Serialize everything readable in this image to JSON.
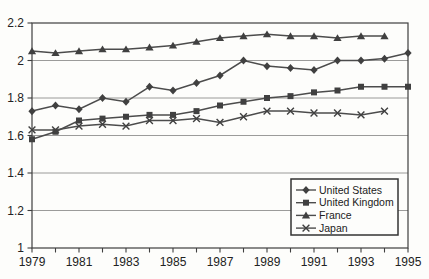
{
  "colors": {
    "background": "#fdfdfb",
    "axis": "#3f3f3f",
    "grid": "#828282",
    "line": "#4c4c4c",
    "marker": "#404040",
    "text": "#222222",
    "legend_border": "#333333",
    "legend_bg": "#fdfdfb"
  },
  "chart_data": {
    "type": "line",
    "title": "",
    "xlabel": "",
    "ylabel": "",
    "xlim": [
      1979,
      1995
    ],
    "ylim": [
      1,
      2.2
    ],
    "grid": "horizontal",
    "x_tick_labels": [
      "1979",
      "1981",
      "1983",
      "1985",
      "1987",
      "1989",
      "1991",
      "1993",
      "1995"
    ],
    "x_minor_tick_step": 1,
    "y_ticks": [
      1,
      1.2,
      1.4,
      1.6,
      1.8,
      2,
      2.2
    ],
    "y_tick_labels": [
      "1",
      "1.2",
      "1.4",
      "1.6",
      "1.8",
      "2",
      "2.2"
    ],
    "y_gridlines": [
      1.2,
      1.4,
      1.6,
      1.8,
      2
    ],
    "legend": {
      "position": "inside-bottom-right",
      "items": [
        "United States",
        "United Kingdom",
        "France",
        "Japan"
      ]
    },
    "series": [
      {
        "name": "United States",
        "marker": "diamond",
        "x": [
          1979,
          1980,
          1981,
          1982,
          1983,
          1984,
          1985,
          1986,
          1987,
          1988,
          1989,
          1990,
          1991,
          1992,
          1993,
          1994,
          1995
        ],
        "values": [
          1.73,
          1.76,
          1.74,
          1.8,
          1.78,
          1.86,
          1.84,
          1.88,
          1.92,
          2.0,
          1.97,
          1.96,
          1.95,
          2.0,
          2.0,
          2.01,
          2.04
        ]
      },
      {
        "name": "United Kingdom",
        "marker": "square",
        "x": [
          1979,
          1980,
          1981,
          1982,
          1983,
          1984,
          1985,
          1986,
          1987,
          1988,
          1989,
          1990,
          1991,
          1992,
          1993,
          1994,
          1995
        ],
        "values": [
          1.58,
          1.62,
          1.68,
          1.69,
          1.7,
          1.71,
          1.71,
          1.73,
          1.76,
          1.78,
          1.8,
          1.81,
          1.83,
          1.84,
          1.86,
          1.86,
          1.86
        ]
      },
      {
        "name": "France",
        "marker": "triangle",
        "x": [
          1979,
          1980,
          1981,
          1982,
          1983,
          1984,
          1985,
          1986,
          1987,
          1988,
          1989,
          1990,
          1991,
          1992,
          1993,
          1994
        ],
        "values": [
          2.05,
          2.04,
          2.05,
          2.06,
          2.06,
          2.07,
          2.08,
          2.1,
          2.12,
          2.13,
          2.14,
          2.13,
          2.13,
          2.12,
          2.13,
          2.13
        ]
      },
      {
        "name": "Japan",
        "marker": "x",
        "x": [
          1979,
          1980,
          1981,
          1982,
          1983,
          1984,
          1985,
          1986,
          1987,
          1988,
          1989,
          1990,
          1991,
          1992,
          1993,
          1994
        ],
        "values": [
          1.63,
          1.63,
          1.65,
          1.66,
          1.65,
          1.68,
          1.68,
          1.69,
          1.67,
          1.7,
          1.73,
          1.73,
          1.72,
          1.72,
          1.71,
          1.73
        ]
      }
    ]
  }
}
